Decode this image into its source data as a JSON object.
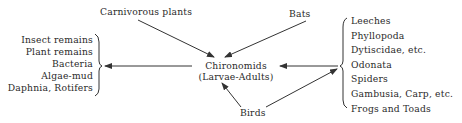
{
  "diagram": {
    "center": {
      "line1": "Chironomids",
      "line2": "(Larvae-Adults)"
    },
    "predators_top": {
      "carnivorous_plants": "Carnivorous plants",
      "bats": "Bats"
    },
    "predator_bottom": "Birds",
    "food_sources": [
      "Insect remains",
      "Plant remains",
      "Bacteria",
      "Algae-mud",
      "Daphnia, Rotifers"
    ],
    "predators_right": [
      "Leeches",
      "Phyllopoda",
      "Dytiscidae, etc.",
      "Odonata",
      "Spiders",
      "Gambusia, Carp, etc.",
      "Frogs and Toads"
    ],
    "line_color": "#333333"
  }
}
